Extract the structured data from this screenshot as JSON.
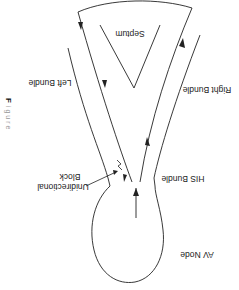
{
  "diagram": {
    "orientation": "rotated-180",
    "labels": {
      "av_node": "AV Node",
      "his_bundle": "HIS Bundle",
      "left_bundle": "Left Bundle",
      "right_bundle": "Right Bundle",
      "septum": "Septum",
      "block_line1": "Unidirectional",
      "block_line2": "Block"
    },
    "caption_fragment": {
      "bold": "F",
      "rest": "i g u r e"
    },
    "colors": {
      "line": "#222222",
      "caption": "#9a9a9a"
    }
  }
}
